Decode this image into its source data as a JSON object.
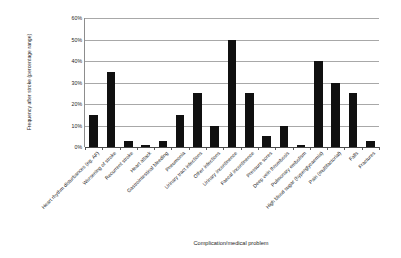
{
  "chart_data": {
    "type": "bar",
    "title": "",
    "xlabel": "Complication/medical problem",
    "ylabel": "Frequency after stroke (percentage range)",
    "ylim": [
      0,
      60
    ],
    "ytick_labels": [
      "0%",
      "10%",
      "20%",
      "30%",
      "40%",
      "50%",
      "60%"
    ],
    "ytick_values": [
      0,
      10,
      20,
      30,
      40,
      50,
      60
    ],
    "grid": true,
    "legend": "none",
    "value_suffix": "%",
    "categories": [
      "Heart rhythm disturbances (eg. AF)",
      "Worsening of stroke",
      "Recurrent stroke",
      "Heart attack",
      "Gastrointestinal bleeding",
      "Pneumonia",
      "Urinary tract infections",
      "Other infections",
      "Urinary incontinence",
      "Faecal incontinence",
      "Pressure sores",
      "Deep vein thrombosis",
      "Pulmonary embolism",
      "High blood sugar (hyperglycaemia)",
      "Pain (multifactorial)",
      "Falls",
      "Fractures"
    ],
    "values": [
      15,
      35,
      3,
      1,
      3,
      15,
      25,
      10,
      50,
      25,
      5,
      10,
      1,
      40,
      30,
      25,
      3
    ],
    "bar_color": "#101010",
    "gridline_color": "#a8a8a8",
    "axis_color": "#8d8d8d"
  }
}
